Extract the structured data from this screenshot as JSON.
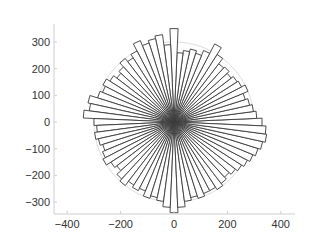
{
  "chart_data": {
    "type": "bar",
    "subtype": "polar-rose-histogram",
    "title": "",
    "xlabel": "",
    "ylabel": "",
    "xlim": [
      -450,
      450
    ],
    "ylim": [
      -350,
      350
    ],
    "x_ticks": [
      -400,
      -200,
      0,
      200,
      400
    ],
    "y_ticks": [
      300,
      200,
      100,
      0,
      -100,
      -200,
      -300
    ],
    "x_tick_labels": [
      "−400",
      "−200",
      "0",
      "200",
      "400"
    ],
    "y_tick_labels": [
      "300",
      "200",
      "100",
      "0",
      "−100",
      "−200",
      "−300"
    ],
    "grid": false,
    "legend": null,
    "bin_width_deg": 5,
    "angles_deg": [
      0,
      5,
      10,
      15,
      20,
      25,
      30,
      35,
      40,
      45,
      50,
      55,
      60,
      65,
      70,
      75,
      80,
      85,
      90,
      95,
      100,
      105,
      110,
      115,
      120,
      125,
      130,
      135,
      140,
      145,
      150,
      155,
      160,
      165,
      170,
      175,
      180,
      185,
      190,
      195,
      200,
      205,
      210,
      215,
      220,
      225,
      230,
      235,
      240,
      245,
      250,
      255,
      260,
      265,
      270,
      275,
      280,
      285,
      290,
      295,
      300,
      305,
      310,
      315,
      320,
      325,
      330,
      335,
      340,
      345,
      350,
      355
    ],
    "values": [
      330,
      310,
      300,
      290,
      280,
      300,
      285,
      280,
      270,
      280,
      275,
      300,
      330,
      290,
      270,
      280,
      270,
      260,
      350,
      290,
      330,
      320,
      310,
      330,
      300,
      285,
      300,
      280,
      270,
      285,
      300,
      290,
      300,
      330,
      320,
      340,
      300,
      290,
      300,
      290,
      280,
      290,
      300,
      280,
      270,
      290,
      300,
      280,
      290,
      280,
      300,
      290,
      300,
      320,
      340,
      320,
      300,
      290,
      300,
      290,
      290,
      300,
      290,
      280,
      290,
      300,
      310,
      320,
      330,
      340,
      350,
      345
    ],
    "reference_circle_radius": 300,
    "colors": {
      "bar_fill": "#ffffff",
      "bar_edge": "#3a3a3a",
      "axis": "#cfcfcf"
    }
  }
}
